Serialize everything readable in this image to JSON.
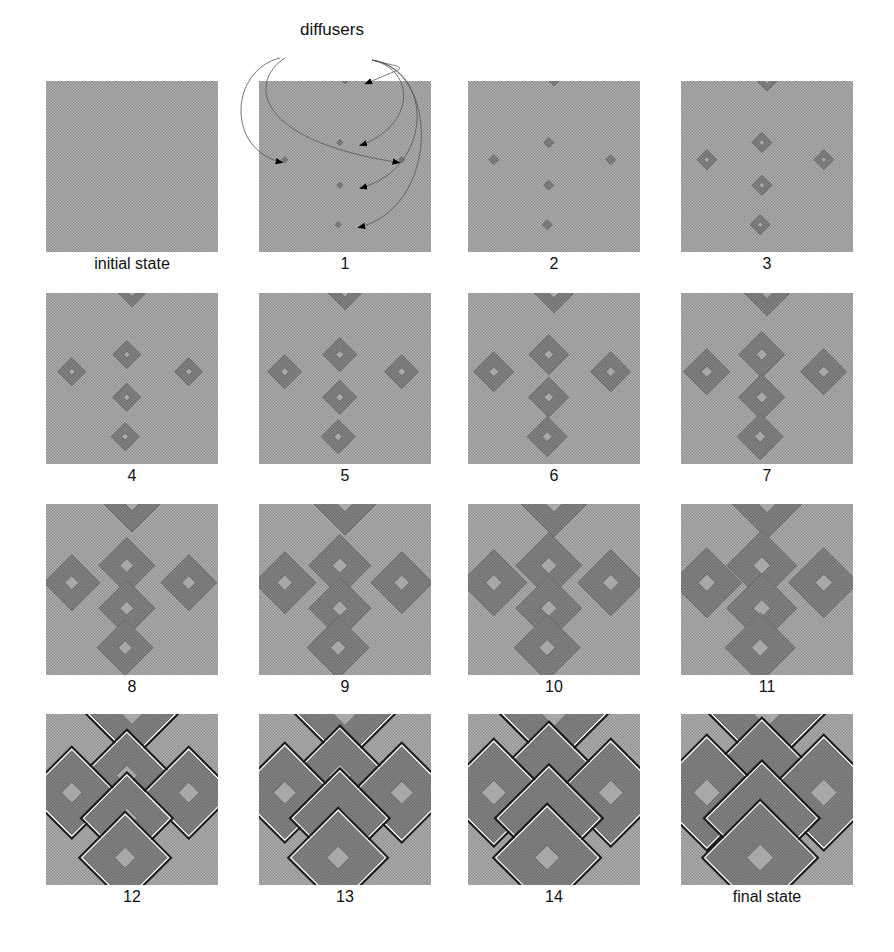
{
  "figure": {
    "annotation": "diffusers",
    "colors": {
      "background_light": "#b4b4b4",
      "background_dark": "#8c8c8c",
      "diamond_outer": "#6a6a6a",
      "diamond_mid": "#8a8a8a",
      "diamond_core": "#a8a8a8",
      "edge_dark": "#1a1a1a",
      "edge_white": "#ffffff"
    },
    "diffuser_positions": [
      {
        "x": 0.5,
        "y": 0.0
      },
      {
        "x": 0.47,
        "y": 0.36
      },
      {
        "x": 0.15,
        "y": 0.46
      },
      {
        "x": 0.83,
        "y": 0.46
      },
      {
        "x": 0.47,
        "y": 0.61
      },
      {
        "x": 0.46,
        "y": 0.84
      }
    ],
    "panels": [
      {
        "label": "initial state",
        "radius": 0,
        "stage": "empty"
      },
      {
        "label": "1",
        "radius": 3,
        "stage": "seed"
      },
      {
        "label": "2",
        "radius": 5,
        "stage": "grow"
      },
      {
        "label": "3",
        "radius": 10,
        "stage": "grow"
      },
      {
        "label": "4",
        "radius": 14,
        "stage": "grow"
      },
      {
        "label": "5",
        "radius": 17,
        "stage": "grow"
      },
      {
        "label": "6",
        "radius": 20,
        "stage": "grow"
      },
      {
        "label": "7",
        "radius": 23,
        "stage": "grow"
      },
      {
        "label": "8",
        "radius": 28,
        "stage": "grow"
      },
      {
        "label": "9",
        "radius": 31,
        "stage": "grow"
      },
      {
        "label": "10",
        "radius": 33,
        "stage": "grow"
      },
      {
        "label": "11",
        "radius": 35,
        "stage": "grow"
      },
      {
        "label": "12",
        "radius": 42,
        "stage": "merge"
      },
      {
        "label": "13",
        "radius": 46,
        "stage": "merge"
      },
      {
        "label": "14",
        "radius": 50,
        "stage": "merge"
      },
      {
        "label": "final state",
        "radius": 54,
        "stage": "merge"
      }
    ]
  }
}
